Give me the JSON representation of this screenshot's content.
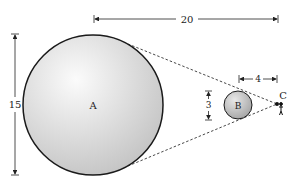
{
  "diagram": {
    "type": "geometry-diagram",
    "objects": {
      "A": {
        "label": "A",
        "shape": "circle"
      },
      "B": {
        "label": "B",
        "shape": "circle"
      },
      "C": {
        "label": "C",
        "shape": "point-observer"
      }
    },
    "dimensions": {
      "distance_A_to_C": "20",
      "distance_B_to_C": "4",
      "diameter_B": "3",
      "diameter_A": "15"
    },
    "colors": {
      "outline": "#1a1a1a",
      "sphere_light": "#f7f7f7",
      "sphere_dark": "#b5b5b5",
      "dashed_line": "#333333"
    }
  }
}
